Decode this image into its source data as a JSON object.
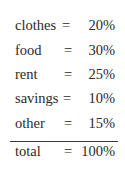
{
  "table": {
    "rows": [
      {
        "label": "clothes",
        "eq": "=",
        "value": "20%"
      },
      {
        "label": "food",
        "eq": "=",
        "value": "30%"
      },
      {
        "label": "rent",
        "eq": "=",
        "value": "25%"
      },
      {
        "label": "savings",
        "eq": "=",
        "value": "10%"
      },
      {
        "label": "other",
        "eq": "=",
        "value": "15%"
      }
    ],
    "total": {
      "label": "total",
      "eq": "=",
      "value": "100%"
    }
  }
}
